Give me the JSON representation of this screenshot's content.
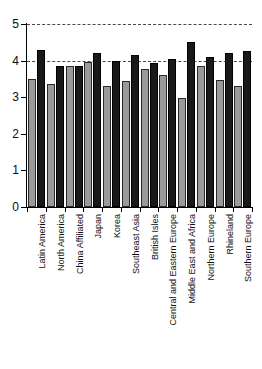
{
  "chart_data": {
    "type": "bar",
    "title": "",
    "subtitle": "",
    "xlabel": "",
    "ylabel": "",
    "ylim": [
      0,
      5
    ],
    "yticks": [
      0,
      1,
      2,
      3,
      4,
      5
    ],
    "ytick_labels": [
      "0",
      "1",
      "2",
      "3",
      "4",
      "5"
    ],
    "grid": "dashed horizontal reference lines at y = 4 and y = 5",
    "gridlines": [
      4,
      5
    ],
    "legend": "none",
    "legend_position": "none",
    "orientation": "vertical",
    "grouping": "grouped",
    "categories": [
      "Latin America",
      "North America",
      "China Affiliated",
      "Japan",
      "Korea",
      "Southeast Asia",
      "British Isles",
      "Central and Eastern Europe",
      "Middle East and Africa",
      "Northern Europe",
      "Rhineland",
      "Southern Europe"
    ],
    "series": [
      {
        "name": "light-gray-bar",
        "color": "#9a9a9a",
        "values": [
          3.5,
          3.35,
          3.85,
          3.95,
          3.3,
          3.45,
          3.78,
          3.62,
          2.97,
          3.85,
          3.47,
          3.3
        ]
      },
      {
        "name": "dark-bar",
        "color": "#191919",
        "values": [
          4.28,
          3.86,
          3.86,
          4.21,
          4.0,
          4.14,
          3.93,
          4.04,
          4.52,
          4.09,
          4.21,
          4.25
        ]
      }
    ]
  },
  "axis": {
    "y_min_label": "0",
    "y_max_label": "5"
  }
}
